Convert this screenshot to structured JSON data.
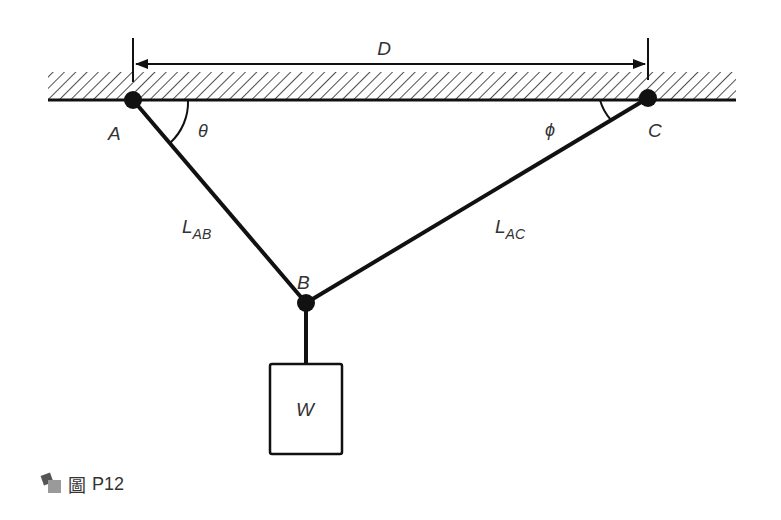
{
  "figure": {
    "caption_char": "圖",
    "caption_id": "P12",
    "labels": {
      "dimension": "D",
      "point_a": "A",
      "point_b": "B",
      "point_c": "C",
      "angle_a": "θ",
      "angle_c": "ϕ",
      "length_ab": "L",
      "length_ab_sub": "AB",
      "length_ac": "L",
      "length_ac_sub": "AC",
      "weight": "W"
    },
    "colors": {
      "line": "#111111",
      "text": "#333333",
      "background": "#ffffff"
    }
  }
}
